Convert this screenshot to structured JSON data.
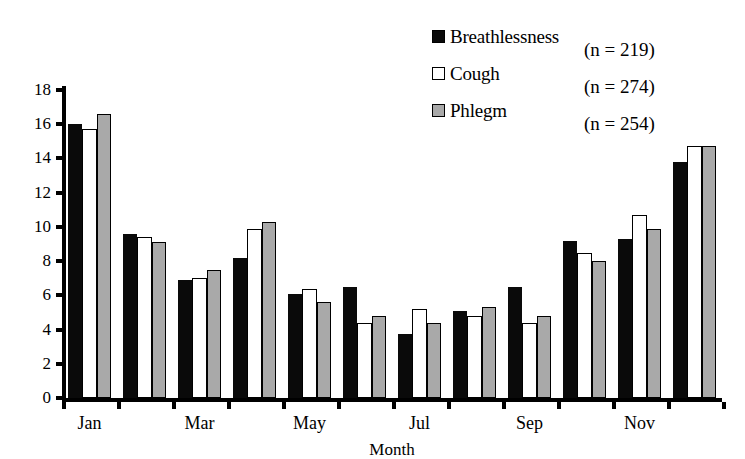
{
  "chart_data": {
    "type": "bar",
    "title": "",
    "xlabel": "Month",
    "ylabel": "",
    "ylim": [
      0,
      18
    ],
    "ytick_step": 2,
    "ytick_labels": [
      "0",
      "2",
      "4",
      "6",
      "8",
      "10",
      "12",
      "14",
      "16",
      "18"
    ],
    "grid": false,
    "legend_position": "top-right",
    "categories": [
      "Jan",
      "Feb",
      "Mar",
      "Apr",
      "May",
      "Jun",
      "Jul",
      "Aug",
      "Sep",
      "Oct",
      "Nov",
      "Dec"
    ],
    "xtick_labels": [
      "Jan",
      "",
      "Mar",
      "",
      "May",
      "",
      "Jul",
      "",
      "Sep",
      "",
      "Nov",
      ""
    ],
    "series": [
      {
        "name": "Breathlessness",
        "n_label": "(n = 219)",
        "color": "#0a0a0a",
        "values": [
          16.0,
          9.6,
          6.9,
          8.2,
          6.1,
          6.5,
          3.75,
          5.1,
          6.5,
          9.2,
          9.3,
          13.8
        ]
      },
      {
        "name": "Cough",
        "n_label": "(n = 274)",
        "color": "#ffffff",
        "values": [
          15.7,
          9.4,
          7.0,
          9.9,
          6.4,
          4.4,
          5.2,
          4.8,
          4.4,
          8.5,
          10.7,
          14.7
        ]
      },
      {
        "name": "Phlegm",
        "n_label": "(n = 254)",
        "color": "#a9a9a9",
        "values": [
          16.6,
          9.1,
          7.5,
          10.3,
          5.6,
          4.8,
          4.4,
          5.3,
          4.8,
          8.0,
          9.9,
          14.7
        ]
      }
    ]
  }
}
